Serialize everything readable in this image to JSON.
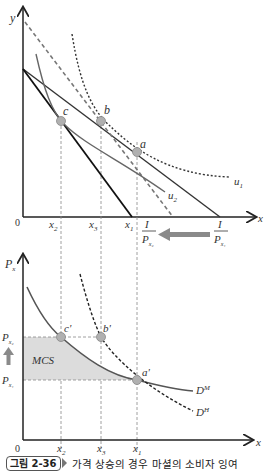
{
  "top_panel": {
    "y_axis_label": "y",
    "x_axis_label": "x",
    "origin_label": "0",
    "x_ticks": [
      {
        "label": "x",
        "sub": "2",
        "x": 61
      },
      {
        "label": "x",
        "sub": "3",
        "x": 101
      },
      {
        "label": "x",
        "sub": "1",
        "x": 137
      }
    ],
    "points": [
      {
        "label": "c",
        "x": 61,
        "y": 121
      },
      {
        "label": "b",
        "x": 101,
        "y": 121
      },
      {
        "label": "a",
        "x": 137,
        "y": 152
      }
    ],
    "curve_labels": {
      "u1": "u",
      "u1_sub": "1",
      "u2": "u",
      "u2_sub": "2"
    },
    "intercepts": {
      "new": {
        "num": "I",
        "den": "P",
        "den_sub": "x₂"
      },
      "old": {
        "num": "I",
        "den": "P",
        "den_sub": "x₁"
      }
    }
  },
  "bottom_panel": {
    "y_axis_label": "P",
    "y_axis_sub": "x",
    "x_axis_label": "x",
    "origin_label": "0",
    "price_labels": [
      {
        "label": "P",
        "sub": "x₂",
        "y": 337
      },
      {
        "label": "P",
        "sub": "x₁",
        "y": 380
      }
    ],
    "points": [
      {
        "label": "c'",
        "x": 61,
        "y": 337
      },
      {
        "label": "b'",
        "x": 101,
        "y": 337
      },
      {
        "label": "a'",
        "x": 137,
        "y": 380
      }
    ],
    "area_label": "MCS",
    "curve_labels": {
      "marshallian": "D",
      "marshallian_sup": "M",
      "hicksian": "D",
      "hicksian_sup": "H"
    },
    "x_ticks": [
      {
        "label": "x",
        "sub": "2"
      },
      {
        "label": "x",
        "sub": "3"
      },
      {
        "label": "x",
        "sub": "1"
      }
    ]
  },
  "caption": {
    "badge": "그림 2-36",
    "text": "가격 상승의 경우 마셜의 소비자 잉여"
  },
  "colors": {
    "axis": "#222222",
    "curve_gray": "#555555",
    "point_fill": "#b0b0b0",
    "shade": "#dcdcdc",
    "arrow": "#8a8a8a"
  }
}
